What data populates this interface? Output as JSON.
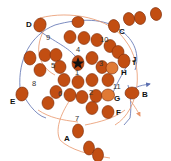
{
  "diagram": {
    "colors": {
      "cell_fill": "#c24e12",
      "cell_light_fill": "#e07a35",
      "cell_stroke": "#7a2c0a",
      "blue_line": "#5b6fb0",
      "orange_line": "#e8956a",
      "background": "#ffffff"
    },
    "center_marker": "star-icon",
    "letter_labels": [
      {
        "id": "A",
        "text": "A"
      },
      {
        "id": "B",
        "text": "B"
      },
      {
        "id": "C",
        "text": "C"
      },
      {
        "id": "D",
        "text": "D"
      },
      {
        "id": "E",
        "text": "E"
      },
      {
        "id": "F",
        "text": "F"
      },
      {
        "id": "G",
        "text": "G"
      },
      {
        "id": "H",
        "text": "H"
      },
      {
        "id": "I",
        "text": "I"
      },
      {
        "id": "J",
        "text": "J"
      }
    ],
    "number_labels": [
      {
        "id": "1",
        "text": "1"
      },
      {
        "id": "2",
        "text": "2"
      },
      {
        "id": "3",
        "text": "3"
      },
      {
        "id": "4",
        "text": "4"
      },
      {
        "id": "5",
        "text": "5"
      },
      {
        "id": "6",
        "text": "6"
      },
      {
        "id": "7",
        "text": "7"
      },
      {
        "id": "8",
        "text": "8"
      },
      {
        "id": "9",
        "text": "9"
      },
      {
        "id": "10",
        "text": "10"
      },
      {
        "id": "11",
        "text": "11"
      }
    ]
  }
}
